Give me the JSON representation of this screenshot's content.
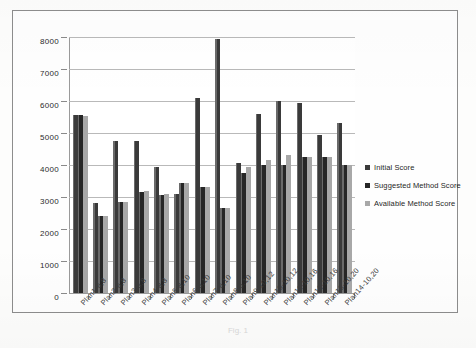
{
  "chart_data": {
    "type": "bar",
    "title": "",
    "xlabel": "",
    "ylabel": "",
    "ylim": [
      0,
      8000
    ],
    "yticks": [
      0,
      1000,
      2000,
      3000,
      4000,
      5000,
      6000,
      7000,
      8000
    ],
    "grid": true,
    "legend_position": "right",
    "categories": [
      "Plan1-6,8",
      "Plan2-6,8",
      "Plan3-8,8",
      "Plan4-8,8",
      "Plan5-8,10",
      "Plan6-8,10",
      "Plan7-6,10",
      "Plan8-6,10",
      "Plan9-10,12",
      "Plan10-10,12",
      "Plan11-10,16",
      "Plan12-10,16",
      "Plan13-10,20",
      "Plan14-10,20"
    ],
    "series": [
      {
        "name": "Initial Score",
        "color": "#3a3a3a",
        "values": [
          5550,
          2800,
          4750,
          4750,
          3950,
          3100,
          6100,
          7950,
          4050,
          5600,
          6000,
          5950,
          4950,
          5300
        ]
      },
      {
        "name": "Suggested Method Score",
        "color": "#262626",
        "values": [
          5550,
          2400,
          2850,
          3150,
          3050,
          3450,
          3300,
          2650,
          3750,
          4000,
          4000,
          4250,
          4250,
          4000
        ]
      },
      {
        "name": "Available Method Score",
        "color": "#a8a8a8",
        "values": [
          5520,
          2400,
          2850,
          3200,
          3100,
          3450,
          3300,
          2650,
          3950,
          4150,
          4300,
          4250,
          4250,
          4000
        ]
      }
    ]
  },
  "legend": {
    "items": [
      {
        "label": "Initial Score"
      },
      {
        "label": "Suggested Method Score"
      },
      {
        "label": "Available Method Score"
      }
    ]
  },
  "caption": {
    "text": "Fig. 1"
  }
}
